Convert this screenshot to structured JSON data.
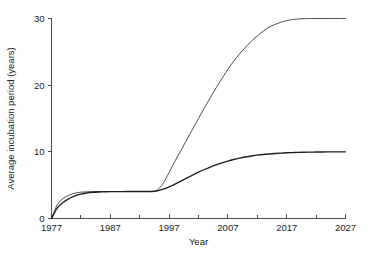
{
  "chart_data": {
    "type": "line",
    "title": "",
    "subtitle": "",
    "xlabel": "Year",
    "ylabel": "Average incubation period (years)",
    "xlim": [
      1977,
      2027
    ],
    "ylim": [
      0,
      30
    ],
    "grid": false,
    "legend": "none",
    "x_major_ticks": [
      1977,
      1987,
      1997,
      2007,
      2017,
      2027
    ],
    "x_major_tick_labels": [
      "1977",
      "1987",
      "1997",
      "2007",
      "2017",
      "2027"
    ],
    "x_minor_ticks": [
      1982,
      1992,
      2002,
      2012,
      2022
    ],
    "y_ticks": [
      0,
      10,
      20,
      30
    ],
    "y_tick_labels": [
      "0",
      "10",
      "20",
      "30"
    ],
    "series": [
      {
        "name": "upper-curve",
        "style": "thin-line",
        "color": "#3b3b3b",
        "x": [
          1977,
          1978,
          1979,
          1980,
          1981,
          1982,
          1983,
          1984,
          1985,
          1986,
          1987,
          1988,
          1989,
          1990,
          1991,
          1992,
          1993,
          1994,
          1995,
          1996,
          1997,
          1998,
          1999,
          2000,
          2001,
          2002,
          2003,
          2004,
          2005,
          2006,
          2007,
          2008,
          2009,
          2010,
          2011,
          2012,
          2013,
          2014,
          2015,
          2016,
          2017,
          2018,
          2019,
          2020,
          2021,
          2022,
          2023,
          2024,
          2025,
          2026,
          2027
        ],
        "y": [
          0.0,
          2.1,
          3.0,
          3.5,
          3.8,
          3.95,
          4.0,
          4.05,
          4.05,
          4.05,
          4.05,
          4.05,
          4.05,
          4.05,
          4.05,
          4.05,
          4.05,
          4.05,
          4.3,
          5.3,
          6.9,
          8.6,
          10.2,
          11.8,
          13.4,
          15.0,
          16.6,
          18.1,
          19.6,
          21.0,
          22.4,
          23.6,
          24.7,
          25.7,
          26.6,
          27.4,
          28.1,
          28.7,
          29.1,
          29.45,
          29.7,
          29.85,
          29.93,
          29.97,
          29.99,
          30.0,
          30.0,
          30.0,
          30.0,
          30.0,
          30.0
        ]
      },
      {
        "name": "lower-curve",
        "style": "solid-line",
        "color": "#1e1e1e",
        "x": [
          1977,
          1978,
          1979,
          1980,
          1981,
          1982,
          1983,
          1984,
          1985,
          1986,
          1987,
          1988,
          1989,
          1990,
          1991,
          1992,
          1993,
          1994,
          1995,
          1996,
          1997,
          1998,
          1999,
          2000,
          2001,
          2002,
          2003,
          2004,
          2005,
          2006,
          2007,
          2008,
          2009,
          2010,
          2011,
          2012,
          2013,
          2014,
          2015,
          2016,
          2017,
          2018,
          2019,
          2020,
          2021,
          2022,
          2023,
          2024,
          2025,
          2026,
          2027
        ],
        "y": [
          0.0,
          1.6,
          2.45,
          3.0,
          3.4,
          3.65,
          3.82,
          3.92,
          3.98,
          4.0,
          4.02,
          4.03,
          4.04,
          4.05,
          4.05,
          4.05,
          4.05,
          4.05,
          4.15,
          4.4,
          4.75,
          5.15,
          5.6,
          6.05,
          6.5,
          6.95,
          7.35,
          7.72,
          8.05,
          8.35,
          8.62,
          8.85,
          9.05,
          9.22,
          9.37,
          9.5,
          9.6,
          9.68,
          9.75,
          9.81,
          9.86,
          9.89,
          9.92,
          9.94,
          9.96,
          9.97,
          9.98,
          9.99,
          9.99,
          10.0,
          10.0
        ]
      }
    ]
  }
}
